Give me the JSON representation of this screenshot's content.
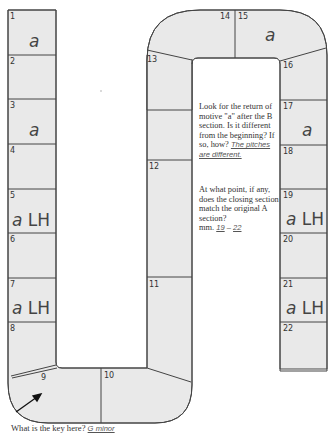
{
  "board": {
    "fill_color": "#e9e9e9",
    "stroke_color": "#444444",
    "cells": [
      {
        "number": "1",
        "motive": "a",
        "hand": ""
      },
      {
        "number": "2",
        "motive": "",
        "hand": ""
      },
      {
        "number": "3",
        "motive": "a",
        "hand": ""
      },
      {
        "number": "4",
        "motive": "",
        "hand": ""
      },
      {
        "number": "5",
        "motive": "a",
        "hand": "LH"
      },
      {
        "number": "6",
        "motive": "",
        "hand": ""
      },
      {
        "number": "7",
        "motive": "a",
        "hand": "LH"
      },
      {
        "number": "8",
        "motive": "",
        "hand": ""
      },
      {
        "number": "9",
        "motive": "",
        "hand": ""
      },
      {
        "number": "10",
        "motive": "",
        "hand": ""
      },
      {
        "number": "11",
        "motive": "",
        "hand": ""
      },
      {
        "number": "12",
        "motive": "",
        "hand": ""
      },
      {
        "number": "13",
        "motive": "",
        "hand": ""
      },
      {
        "number": "14",
        "motive": "",
        "hand": ""
      },
      {
        "number": "15",
        "motive": "a",
        "hand": ""
      },
      {
        "number": "16",
        "motive": "",
        "hand": ""
      },
      {
        "number": "17",
        "motive": "a",
        "hand": ""
      },
      {
        "number": "18",
        "motive": "",
        "hand": ""
      },
      {
        "number": "19",
        "motive": "a",
        "hand": "LH"
      },
      {
        "number": "20",
        "motive": "",
        "hand": ""
      },
      {
        "number": "21",
        "motive": "a",
        "hand": "LH"
      },
      {
        "number": "22",
        "motive": "",
        "hand": ""
      }
    ]
  },
  "questions": {
    "return_motive": {
      "text": "Look for the return of motive \"a\" after the B section. Is it different from the beginning? If so, how?",
      "answer": "The pitches are different."
    },
    "closing_section": {
      "text": "At what point, if any, does the closing section match the original A section?",
      "prefix": "mm.",
      "answer_start": "19",
      "separator": "–",
      "answer_end": "22"
    },
    "key": {
      "text": "What is the key here?",
      "answer": "G minor"
    }
  }
}
